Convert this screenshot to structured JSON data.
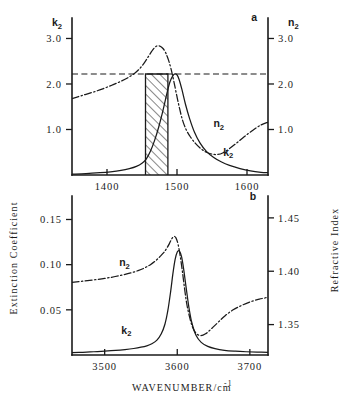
{
  "figure": {
    "left_axis_title": "Extinction Coefficient",
    "right_axis_title": "Refractive Index",
    "x_axis_title_main": "WAVENUMBER/cm",
    "x_axis_title_exponent": "-1"
  },
  "chart_data": [
    {
      "id": "panel-a",
      "type": "line",
      "panel_label": "a",
      "title": "",
      "xlabel": "WAVENUMBER/cm-1",
      "ylabel": "Extinction Coefficient",
      "y2label": "Refractive Index",
      "xlim": [
        1350,
        1630
      ],
      "xticks": [
        1400,
        1500,
        1600
      ],
      "xticklabels": [
        "1400",
        "1500",
        "1600"
      ],
      "ylim": [
        0,
        3.45
      ],
      "yticks": [
        1.0,
        2.0,
        3.0
      ],
      "yticklabels": [
        "1.0",
        "2.0",
        "3.0"
      ],
      "y2lim": [
        0,
        3.45
      ],
      "y2ticks": [
        1.0,
        2.0,
        3.0
      ],
      "y2ticklabels": [
        "1.0",
        "2.0",
        "3.0"
      ],
      "y_symbol": "k",
      "y_symbol_sub": "2",
      "y2_symbol": "n",
      "y2_symbol_sub": "2",
      "grid": false,
      "legend_position": "inline-annotations",
      "annotations": [
        {
          "text": "n",
          "sub": "2",
          "x": 1552,
          "y": 1.05,
          "name": "curve-label-n2"
        },
        {
          "text": "k",
          "sub": "2",
          "x": 1566,
          "y": 0.42,
          "name": "curve-label-k2"
        },
        {
          "text": "a",
          "x": 1606,
          "y": 3.38,
          "name": "panel-label-a"
        }
      ],
      "guide_line": {
        "type": "horizontal-dashed",
        "y": 2.22,
        "x_from": 1350,
        "x_to": 1630
      },
      "shaded_band": {
        "type": "hatched",
        "x_from": 1455,
        "x_to": 1487,
        "y_from": 0,
        "y_to": 2.22
      },
      "series": [
        {
          "name": "k2",
          "style": "solid",
          "x": [
            1350,
            1370,
            1390,
            1405,
            1420,
            1432,
            1442,
            1450,
            1456,
            1462,
            1468,
            1474,
            1480,
            1486,
            1490,
            1494,
            1497,
            1500,
            1503,
            1507,
            1512,
            1518,
            1525,
            1533,
            1542,
            1552,
            1563,
            1575,
            1590,
            1605,
            1620,
            1630
          ],
          "y": [
            0.02,
            0.03,
            0.05,
            0.07,
            0.1,
            0.14,
            0.19,
            0.26,
            0.35,
            0.52,
            0.76,
            1.06,
            1.42,
            1.82,
            2.05,
            2.18,
            2.22,
            2.2,
            2.1,
            1.88,
            1.56,
            1.24,
            0.94,
            0.7,
            0.52,
            0.39,
            0.29,
            0.21,
            0.14,
            0.09,
            0.06,
            0.05
          ]
        },
        {
          "name": "n2",
          "style": "dash-dot",
          "x": [
            1350,
            1365,
            1380,
            1395,
            1408,
            1420,
            1430,
            1440,
            1448,
            1454,
            1459,
            1464,
            1468,
            1472,
            1476,
            1480,
            1484,
            1488,
            1492,
            1496,
            1500,
            1504,
            1508,
            1513,
            1519,
            1526,
            1534,
            1542,
            1550,
            1558,
            1566,
            1575,
            1585,
            1596,
            1608,
            1620,
            1630
          ],
          "y": [
            1.68,
            1.75,
            1.82,
            1.9,
            1.98,
            2.06,
            2.14,
            2.24,
            2.36,
            2.48,
            2.6,
            2.72,
            2.8,
            2.84,
            2.83,
            2.78,
            2.68,
            2.52,
            2.3,
            2.02,
            1.72,
            1.44,
            1.2,
            1.0,
            0.84,
            0.7,
            0.58,
            0.5,
            0.46,
            0.45,
            0.49,
            0.58,
            0.7,
            0.84,
            0.98,
            1.1,
            1.16
          ]
        }
      ]
    },
    {
      "id": "panel-b",
      "type": "line",
      "panel_label": "b",
      "title": "",
      "xlabel": "WAVENUMBER/cm-1",
      "ylabel": "Extinction Coefficient",
      "y2label": "Refractive Index",
      "xlim": [
        3455,
        3725
      ],
      "xticks": [
        3500,
        3600,
        3700
      ],
      "xticklabels": [
        "3500",
        "3600",
        "3700"
      ],
      "ylim": [
        0,
        0.176
      ],
      "yticks": [
        0.05,
        0.1,
        0.15
      ],
      "yticklabels": [
        "0.05",
        "0.10",
        "0.15"
      ],
      "y2lim": [
        1.3215,
        1.4705
      ],
      "y2ticks": [
        1.35,
        1.4,
        1.45
      ],
      "y2ticklabels": [
        "1.35",
        "1.40",
        "1.45"
      ],
      "grid": false,
      "legend_position": "inline-annotations",
      "annotations": [
        {
          "text": "n",
          "sub": "2",
          "x": 3520,
          "y": 0.0985,
          "name": "curve-label-n2"
        },
        {
          "text": "k",
          "sub": "2",
          "x": 3523,
          "y": 0.0235,
          "name": "curve-label-k2"
        },
        {
          "text": "b",
          "x": 3700,
          "y": 0.172,
          "name": "panel-label-b"
        }
      ],
      "series": [
        {
          "name": "k2",
          "style": "solid",
          "x": [
            3455,
            3470,
            3485,
            3500,
            3515,
            3528,
            3540,
            3550,
            3558,
            3565,
            3572,
            3578,
            3583,
            3587,
            3591,
            3594,
            3597,
            3600,
            3603,
            3606,
            3609,
            3612,
            3616,
            3620,
            3626,
            3633,
            3642,
            3652,
            3665,
            3680,
            3695,
            3710,
            3725
          ],
          "y": [
            0.0025,
            0.003,
            0.0036,
            0.0042,
            0.005,
            0.006,
            0.0072,
            0.0086,
            0.0102,
            0.0125,
            0.0165,
            0.0235,
            0.034,
            0.049,
            0.071,
            0.09,
            0.1055,
            0.114,
            0.115,
            0.1085,
            0.094,
            0.076,
            0.053,
            0.036,
            0.0215,
            0.014,
            0.0095,
            0.007,
            0.0052,
            0.0042,
            0.0036,
            0.0032,
            0.003
          ]
        },
        {
          "name": "n2",
          "style": "dash-dot",
          "x": [
            3455,
            3470,
            3485,
            3500,
            3513,
            3525,
            3536,
            3546,
            3555,
            3563,
            3570,
            3576,
            3581,
            3585,
            3589,
            3592,
            3595,
            3598,
            3601,
            3604,
            3607,
            3610,
            3613,
            3617,
            3621,
            3626,
            3632,
            3639,
            3647,
            3656,
            3666,
            3677,
            3689,
            3701,
            3713,
            3725
          ],
          "y": [
            0.0805,
            0.0818,
            0.0832,
            0.0848,
            0.0866,
            0.0886,
            0.0908,
            0.0934,
            0.0964,
            0.1,
            0.1042,
            0.1088,
            0.113,
            0.1175,
            0.123,
            0.128,
            0.131,
            0.13,
            0.123,
            0.11,
            0.093,
            0.074,
            0.057,
            0.042,
            0.031,
            0.024,
            0.0215,
            0.0235,
            0.029,
            0.036,
            0.0435,
            0.05,
            0.055,
            0.059,
            0.0618,
            0.0638
          ]
        }
      ]
    }
  ]
}
